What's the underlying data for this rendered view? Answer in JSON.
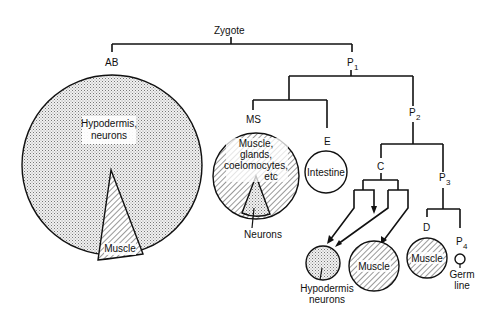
{
  "diagram": {
    "nodes": {
      "zygote": "Zygote",
      "ab": "AB",
      "p1": "P",
      "p1_sub": "1",
      "ms": "MS",
      "e": "E",
      "p2": "P",
      "p2_sub": "2",
      "c": "C",
      "p3": "P",
      "p3_sub": "3",
      "d": "D",
      "p4": "P",
      "p4_sub": "4"
    },
    "fates": {
      "ab_main_1": "Hypodermis,",
      "ab_main_2": "neurons",
      "ab_wedge": "Muscle",
      "ms_main_1": "Muscle,",
      "ms_main_2": "glands,",
      "ms_main_3": "coelomocytes,",
      "ms_main_4": "etc",
      "ms_wedge": "Neurons",
      "e_main": "Intestine",
      "c_hyp_1": "Hypodermis",
      "c_hyp_2": "neurons",
      "c_muscle": "Muscle",
      "d_muscle": "Muscle",
      "p4_1": "Germ",
      "p4_2": "line"
    },
    "legend_patterns": {
      "dotted": "hypodermis/neurons/ectoderm",
      "hatched": "muscle/mesoderm",
      "plain": "intestine/germ line"
    }
  }
}
